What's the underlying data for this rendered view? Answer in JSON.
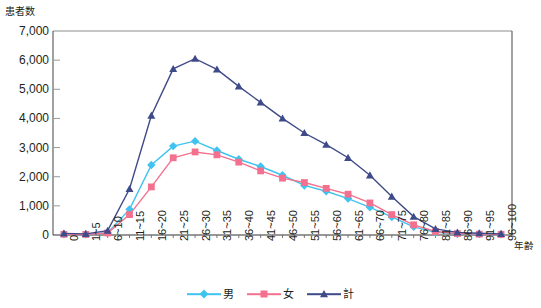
{
  "chart_data": {
    "type": "line",
    "title": "",
    "xlabel": "年齢",
    "ylabel": "患者数",
    "ylim": [
      0,
      7000
    ],
    "ytick_step": 1000,
    "grid": false,
    "legend_position": "bottom",
    "categories": [
      "0",
      "1~5",
      "6~10",
      "11~15",
      "16~20",
      "21~25",
      "26~30",
      "31~35",
      "36~40",
      "41~45",
      "46~50",
      "51~55",
      "56~60",
      "61~65",
      "66~70",
      "71~75",
      "76~80",
      "81~85",
      "86~90",
      "91~95",
      "96~100"
    ],
    "ytick_labels": [
      "0",
      "1,000",
      "2,000",
      "3,000",
      "4,000",
      "5,000",
      "6,000",
      "7,000"
    ],
    "ytick_values": [
      0,
      1000,
      2000,
      3000,
      4000,
      5000,
      6000,
      7000
    ],
    "series": [
      {
        "name": "男",
        "color": "#3fc3ef",
        "marker": "diamond",
        "values": [
          30,
          20,
          80,
          880,
          2400,
          3050,
          3220,
          2900,
          2600,
          2350,
          2050,
          1700,
          1500,
          1250,
          950,
          620,
          280,
          90,
          40,
          30,
          20
        ]
      },
      {
        "name": "女",
        "color": "#f3718f",
        "marker": "square",
        "values": [
          25,
          20,
          70,
          700,
          1650,
          2650,
          2850,
          2750,
          2500,
          2200,
          1950,
          1800,
          1600,
          1400,
          1100,
          700,
          350,
          120,
          50,
          30,
          20
        ]
      },
      {
        "name": "計",
        "color": "#3f4a88",
        "marker": "triangle",
        "values": [
          55,
          40,
          150,
          1580,
          4100,
          5700,
          6050,
          5680,
          5100,
          4550,
          4000,
          3500,
          3100,
          2650,
          2050,
          1320,
          630,
          210,
          90,
          60,
          40
        ]
      }
    ]
  },
  "legend": {
    "items": [
      {
        "label": "男"
      },
      {
        "label": "女"
      },
      {
        "label": "計"
      }
    ]
  }
}
